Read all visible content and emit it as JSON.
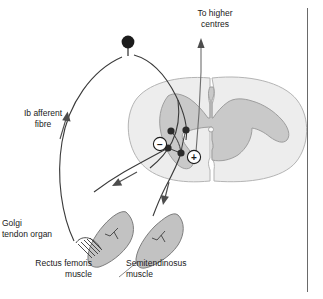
{
  "figure": {
    "kind": "anatomical-diagram",
    "background_color": "#ffffff"
  },
  "labels": {
    "to_higher_centres": "To higher\ncentres",
    "ib_afferent_fibre": "Ib afferent\nfibre",
    "golgi_tendon_organ": "Golgi\ntendon organ",
    "rectus_femoris_muscle": "Rectus femoris\nmuscle",
    "semitendinosus_muscle": "Semitendinosus\nmuscle"
  },
  "symbols": {
    "inhibitory": "−",
    "excitatory": "+"
  },
  "colors": {
    "line": "#3a3a3a",
    "text": "#1a1a1a",
    "white_matter_fill": "#ededed",
    "white_matter_stroke": "#b4b4b4",
    "gray_matter_fill": "#c9c9c9",
    "gray_matter_stroke": "#9e9e9e",
    "muscle_fill": "#c2c2c2",
    "muscle_stroke": "#7d7d7d",
    "synapse_dot": "#2b2b2b",
    "cell_body": "#1c1c1c",
    "divider": "#6a6a6a"
  },
  "anatomy": {
    "spinal_cord": {
      "name": "spinal-cord-cross-section",
      "white_matter": "oval outer region",
      "gray_matter": "butterfly-shaped inner region",
      "central_canal": "small opening at centre"
    },
    "cell_body": {
      "name": "dorsal-root-ganglion-cell-body",
      "shape": "filled circle on short stalk"
    },
    "synapses": [
      {
        "name": "synapse-dot-1",
        "x": 171,
        "y": 131
      },
      {
        "name": "synapse-dot-2",
        "x": 186,
        "y": 130
      },
      {
        "name": "synapse-dot-3",
        "x": 168,
        "y": 148
      },
      {
        "name": "synapse-dot-4",
        "x": 181,
        "y": 153
      }
    ],
    "sign_markers": [
      {
        "name": "inhibitory-sign-marker",
        "symbol": "−",
        "x": 160,
        "y": 144
      },
      {
        "name": "excitatory-sign-marker",
        "symbol": "+",
        "x": 194,
        "y": 157
      }
    ],
    "muscles": [
      {
        "name": "rectus-femoris-muscle-shape",
        "has_golgi_tendon_organ": true
      },
      {
        "name": "semitendinosus-muscle-shape",
        "has_golgi_tendon_organ": false
      }
    ],
    "arrows": [
      {
        "name": "ascending-tract-arrow",
        "direction": "up",
        "meaning": "to higher centres"
      },
      {
        "name": "afferent-direction-arrow",
        "direction": "up-right",
        "meaning": "Ib afferent conduction toward cord"
      },
      {
        "name": "efferent-arrow-rectus",
        "direction": "down-left",
        "meaning": "motor output to rectus femoris"
      },
      {
        "name": "efferent-arrow-semitendinosus",
        "direction": "down",
        "meaning": "motor output to semitendinosus"
      }
    ]
  }
}
